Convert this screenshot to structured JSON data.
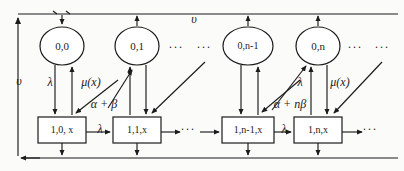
{
  "diagram": {
    "type": "markov-state-transition",
    "circles": [
      {
        "id": "c0",
        "label": "0,0",
        "cx": 62,
        "cy": 46,
        "rx": 22,
        "ry": 19
      },
      {
        "id": "c1",
        "label": "0,1",
        "cx": 137,
        "cy": 46,
        "rx": 22,
        "ry": 19
      },
      {
        "id": "c2",
        "label": "0,n-1",
        "cx": 248,
        "cy": 46,
        "rx": 25,
        "ry": 19
      },
      {
        "id": "c3",
        "label": "0,n",
        "cx": 318,
        "cy": 46,
        "rx": 22,
        "ry": 19
      }
    ],
    "boxes": [
      {
        "id": "b0",
        "label": "1,0, x",
        "x": 38,
        "y": 117,
        "w": 48,
        "h": 26
      },
      {
        "id": "b1",
        "label": "1,1,x",
        "x": 113,
        "y": 117,
        "w": 48,
        "h": 26
      },
      {
        "id": "b2",
        "label": "1,n-1,x",
        "x": 222,
        "y": 117,
        "w": 52,
        "h": 26
      },
      {
        "id": "b3",
        "label": "1,n,x",
        "x": 294,
        "y": 117,
        "w": 48,
        "h": 26
      }
    ],
    "rate_labels": [
      {
        "id": "r-ups-left",
        "text": "υ",
        "x": 19,
        "y": 82
      },
      {
        "id": "r-ups-top",
        "text": "υ",
        "x": 194,
        "y": 20
      },
      {
        "id": "r-lambda-0",
        "text": "λ",
        "x": 50,
        "y": 83
      },
      {
        "id": "r-mu-0",
        "text": "μ(x)",
        "x": 91,
        "y": 83
      },
      {
        "id": "r-alpha-beta-0",
        "text": "α + β",
        "x": 104,
        "y": 105
      },
      {
        "id": "r-lambda-b0",
        "text": "λ",
        "x": 100,
        "y": 130
      },
      {
        "id": "r-lambda-n",
        "text": "λ",
        "x": 300,
        "y": 83
      },
      {
        "id": "r-mu-n",
        "text": "μ(x)",
        "x": 340,
        "y": 83
      },
      {
        "id": "r-alpha-nbeta",
        "text": "α + nβ",
        "x": 290,
        "y": 105
      },
      {
        "id": "r-lambda-bn",
        "text": "λ",
        "x": 284,
        "y": 130
      }
    ],
    "ellipses_marks": [
      {
        "id": "e-circ-mid-a",
        "text": "···",
        "x": 176,
        "y": 48
      },
      {
        "id": "e-circ-mid-b",
        "text": "···",
        "x": 204,
        "y": 48
      },
      {
        "id": "e-circ-right-a",
        "text": "···",
        "x": 355,
        "y": 48
      },
      {
        "id": "e-circ-right-b",
        "text": "···",
        "x": 382,
        "y": 48
      },
      {
        "id": "e-box-mid",
        "text": "···",
        "x": 188,
        "y": 130
      },
      {
        "id": "e-box-right",
        "text": "···",
        "x": 370,
        "y": 130
      }
    ]
  }
}
